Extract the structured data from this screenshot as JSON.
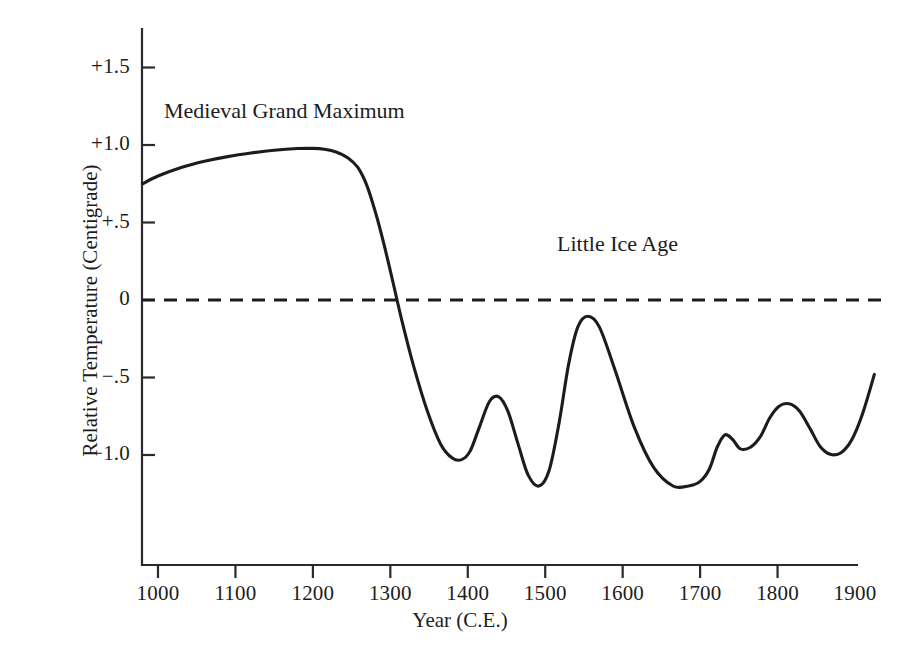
{
  "chart_data": {
    "type": "line",
    "title": "",
    "xlabel": "Year (C.E.)",
    "ylabel": "Relative Temperature (Centigrade)",
    "xlim": [
      970,
      1935
    ],
    "ylim": [
      -1.45,
      1.72
    ],
    "xticks": [
      1000,
      1100,
      1200,
      1300,
      1400,
      1500,
      1600,
      1700,
      1800,
      1900
    ],
    "xtick_labels": [
      "1000",
      "1100",
      "1200",
      "1300",
      "1400",
      "1500",
      "1600",
      "1700",
      "1800",
      "1900"
    ],
    "yticks": [
      1.5,
      1.0,
      0.5,
      0.0,
      -0.5,
      -1.0
    ],
    "ytick_labels": [
      "+1.5",
      "+1.0",
      "+.5",
      "0",
      "−.5",
      "−1.0"
    ],
    "grid": false,
    "legend": "none",
    "zero_reference_line": {
      "value": 0,
      "style": "dashed",
      "color": "#1c1c1c"
    },
    "series": [
      {
        "name": "Relative Temperature",
        "color": "#1c1c1c",
        "x": [
          980,
          1000,
          1030,
          1060,
          1090,
          1120,
          1150,
          1180,
          1200,
          1215,
          1230,
          1245,
          1258,
          1270,
          1282,
          1292,
          1302,
          1315,
          1330,
          1348,
          1365,
          1380,
          1392,
          1403,
          1415,
          1428,
          1440,
          1452,
          1465,
          1478,
          1492,
          1505,
          1518,
          1530,
          1542,
          1555,
          1570,
          1590,
          1615,
          1640,
          1665,
          1685,
          1700,
          1712,
          1722,
          1732,
          1742,
          1752,
          1765,
          1778,
          1790,
          1802,
          1815,
          1828,
          1842,
          1855,
          1868,
          1882,
          1896,
          1910,
          1925
        ],
        "y": [
          0.75,
          0.8,
          0.855,
          0.895,
          0.925,
          0.948,
          0.966,
          0.977,
          0.978,
          0.972,
          0.955,
          0.918,
          0.855,
          0.735,
          0.545,
          0.355,
          0.145,
          -0.135,
          -0.425,
          -0.72,
          -0.93,
          -1.02,
          -1.03,
          -0.975,
          -0.82,
          -0.655,
          -0.625,
          -0.72,
          -0.93,
          -1.13,
          -1.2,
          -1.1,
          -0.79,
          -0.42,
          -0.175,
          -0.105,
          -0.175,
          -0.45,
          -0.82,
          -1.08,
          -1.2,
          -1.2,
          -1.17,
          -1.09,
          -0.95,
          -0.87,
          -0.9,
          -0.96,
          -0.95,
          -0.88,
          -0.76,
          -0.685,
          -0.67,
          -0.715,
          -0.83,
          -0.945,
          -0.995,
          -0.985,
          -0.9,
          -0.73,
          -0.48
        ]
      }
    ],
    "annotations": [
      {
        "id": "medieval",
        "text": "Medieval Grand Maximum",
        "x": 1180,
        "y": 1.28
      },
      {
        "id": "little-ice-age",
        "text": "Little Ice Age",
        "x": 1630,
        "y": 0.37
      }
    ],
    "key_points": {
      "start_value": 0.75,
      "medieval_peak_value": 0.98,
      "medieval_peak_year": 1200,
      "zero_crossing_year": 1290,
      "lia_minimum_value": -1.2,
      "lia_minimum_years": [
        1492,
        1665
      ],
      "lia_peak_value": -0.105,
      "lia_peak_year": 1555,
      "end_value": -0.48,
      "end_year": 1925
    }
  },
  "axes": {
    "y_axis_line": true,
    "x_axis_line": true,
    "tick_direction": "out"
  }
}
